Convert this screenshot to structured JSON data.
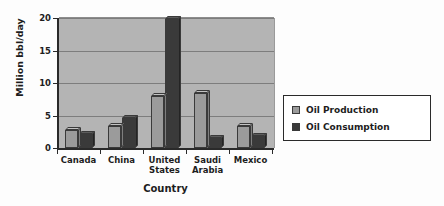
{
  "chart_data": {
    "type": "bar",
    "title": "",
    "xlabel": "Country",
    "ylabel": "Million bbl/day",
    "ylim": [
      0,
      20
    ],
    "yticks": [
      0,
      5,
      10,
      15,
      20
    ],
    "ytick_labels": [
      "0",
      "5",
      "10",
      "15",
      "20"
    ],
    "grid": true,
    "legend_position": "right",
    "categories": [
      "Canada",
      "China",
      "United States",
      "Saudi Arabia",
      "Mexico"
    ],
    "category_labels": [
      "Canada",
      "China",
      "United\nStates",
      "Saudi\nArabia",
      "Mexico"
    ],
    "series": [
      {
        "name": "Oil Production",
        "color": "#9b9b9b",
        "values": [
          2.7,
          3.4,
          8.0,
          8.5,
          3.4
        ]
      },
      {
        "name": "Oil Consumption",
        "color": "#3a3a3a",
        "values": [
          2.1,
          4.6,
          19.9,
          1.6,
          1.9
        ]
      }
    ]
  },
  "legend": {
    "items": [
      {
        "label": "Oil Production",
        "swatch": "production"
      },
      {
        "label": "Oil Consumption",
        "swatch": "consumption"
      }
    ]
  }
}
